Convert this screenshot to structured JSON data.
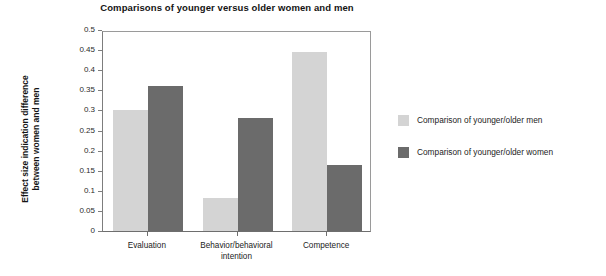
{
  "chart_data": {
    "type": "bar",
    "title": "Comparisons of younger versus older women and men",
    "xlabel": "",
    "ylabel_line1": "Effect size indication difference",
    "ylabel_line2": "between women and men",
    "categories": [
      "Evaluation",
      "Behavior/behavioral intention",
      "Competence"
    ],
    "category_lines": [
      {
        "l1": "Evaluation",
        "l2": ""
      },
      {
        "l1": "Behavior/behavioral",
        "l2": "intention"
      },
      {
        "l1": "Competence",
        "l2": ""
      }
    ],
    "series": [
      {
        "name": "Comparison of younger/older men",
        "color": "#d4d4d4",
        "values": [
          0.3,
          0.083,
          0.445
        ]
      },
      {
        "name": "Comparison of younger/older women",
        "color": "#6b6b6b",
        "values": [
          0.36,
          0.28,
          0.165
        ]
      }
    ],
    "ylim": [
      0,
      0.5
    ],
    "ytick_step": 0.05,
    "yticks": [
      "0.5",
      "0.45",
      "0.4",
      "0.35",
      "0.3",
      "0.25",
      "0.2",
      "0.15",
      "0.1",
      "0.05",
      "0"
    ],
    "ytick_values": [
      0.5,
      0.45,
      0.4,
      0.35,
      0.3,
      0.25,
      0.2,
      0.15,
      0.1,
      0.05,
      0
    ],
    "grid": false,
    "legend_position": "right",
    "frame": true
  }
}
